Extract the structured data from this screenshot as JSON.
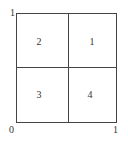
{
  "diagram": {
    "quadrants": [
      {
        "id": "top-right",
        "label": "1"
      },
      {
        "id": "top-left",
        "label": "2"
      },
      {
        "id": "bottom-left",
        "label": "3"
      },
      {
        "id": "bottom-right",
        "label": "4"
      }
    ],
    "axis_labels": {
      "origin": "0",
      "x_max": "1",
      "y_max": "1"
    }
  }
}
